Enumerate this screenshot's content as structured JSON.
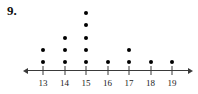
{
  "problem": {
    "number_label": "9."
  },
  "chart_data": {
    "type": "dotplot",
    "title": "",
    "xlabel": "",
    "ylabel": "",
    "grid": false,
    "legend": null,
    "axis": {
      "orientation": "horizontal",
      "left_arrow": true,
      "right_arrow": true,
      "line_color": "#3a3a3a",
      "tick_color": "#3a3a3a",
      "label_color": "#1a1a1a"
    },
    "dot_color": "#000000",
    "categories": [
      13,
      14,
      15,
      16,
      17,
      18,
      19
    ],
    "tick_labels": [
      "13",
      "14",
      "15",
      "16",
      "17",
      "18",
      "19"
    ],
    "values": [
      2,
      3,
      5,
      1,
      2,
      1,
      1
    ],
    "points": [
      {
        "x": 13,
        "count": 2
      },
      {
        "x": 14,
        "count": 3
      },
      {
        "x": 15,
        "count": 5
      },
      {
        "x": 16,
        "count": 1
      },
      {
        "x": 17,
        "count": 2
      },
      {
        "x": 18,
        "count": 1
      },
      {
        "x": 19,
        "count": 1
      }
    ],
    "total_dots": 15,
    "xlim": [
      12.3,
      19.75
    ],
    "ylim": [
      0,
      5
    ]
  },
  "geometry": {
    "axis_y": 70,
    "axis_x_start": 28,
    "axis_x_end": 188,
    "tick_x_start": 43,
    "tick_spacing": 21.5,
    "dot_base_y": 62,
    "dot_spacing_y": 12.2,
    "label_y": 78
  }
}
